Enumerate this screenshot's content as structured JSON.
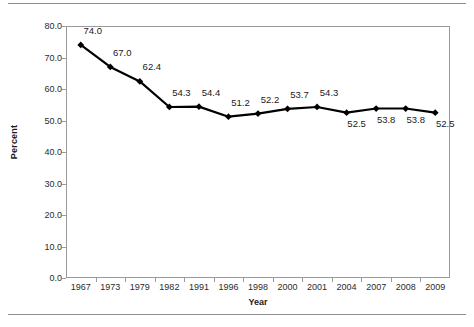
{
  "chart_data": {
    "type": "line",
    "title": "",
    "xlabel": "Year",
    "ylabel": "Percent",
    "categories": [
      "1967",
      "1973",
      "1979",
      "1982",
      "1991",
      "1996",
      "1998",
      "2000",
      "2001",
      "2004",
      "2007",
      "2008",
      "2009"
    ],
    "values": [
      74.0,
      67.0,
      62.4,
      54.3,
      54.4,
      51.2,
      52.2,
      53.7,
      54.3,
      52.5,
      53.8,
      53.8,
      52.5
    ],
    "data_labels": [
      "74.0",
      "67.0",
      "62.4",
      "54.3",
      "54.4",
      "51.2",
      "52.2",
      "53.7",
      "54.3",
      "52.5",
      "53.8",
      "53.8",
      "52.5"
    ],
    "label_positions": [
      "above",
      "above",
      "above",
      "above",
      "above",
      "above",
      "above",
      "above",
      "above",
      "below",
      "below",
      "below",
      "below"
    ],
    "ylim": [
      0.0,
      80.0
    ],
    "ytick_labels": [
      "0.0",
      "10.0",
      "20.0",
      "30.0",
      "40.0",
      "50.0",
      "60.0",
      "70.0",
      "80.0"
    ],
    "ytick_values": [
      0,
      10,
      20,
      30,
      40,
      50,
      60,
      70,
      80
    ],
    "grid": false,
    "legend": "none",
    "series_color": "#000000",
    "marker": "diamond",
    "plot_border_color": "#9a9a9a",
    "rule_color": "#8d8d8d"
  }
}
